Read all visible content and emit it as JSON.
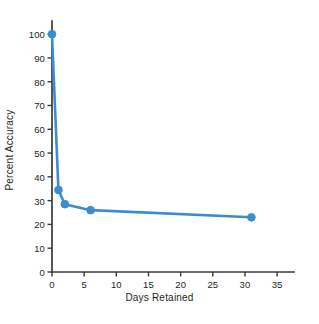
{
  "chart_data": {
    "type": "line",
    "title": "",
    "xlabel": "Days Retained",
    "ylabel": "Percent Accuracy",
    "xlim": [
      0,
      37
    ],
    "ylim": [
      0,
      103
    ],
    "xticks": [
      0,
      5,
      10,
      15,
      20,
      25,
      30,
      35
    ],
    "yticks": [
      0,
      10,
      20,
      30,
      40,
      50,
      60,
      70,
      80,
      90,
      100
    ],
    "grid": false,
    "legend": "none",
    "series": [
      {
        "name": "Retention",
        "color": "#3c8dce",
        "marker": "circle",
        "x": [
          0,
          1,
          2,
          6,
          31
        ],
        "y": [
          100,
          34.5,
          28.5,
          26,
          23
        ]
      }
    ]
  },
  "axis": {
    "x_title": "Days Retained",
    "y_title": "Percent Accuracy",
    "x_tick_labels": [
      "0",
      "5",
      "10",
      "15",
      "20",
      "25",
      "30",
      "35"
    ],
    "y_tick_labels": [
      "0",
      "10",
      "20",
      "30",
      "40",
      "50",
      "60",
      "70",
      "80",
      "90",
      "100"
    ]
  },
  "colors": {
    "series_blue": "#3c8dce",
    "axis": "#3a3a38",
    "text": "#231f20",
    "background": "#ffffff"
  }
}
